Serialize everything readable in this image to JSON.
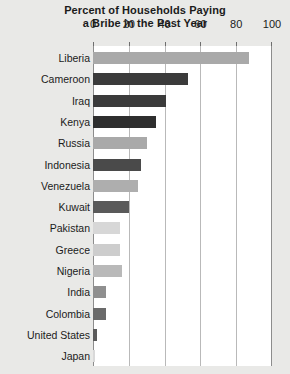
{
  "title": {
    "line1": "Percent of Households Paying",
    "line2": "a Bribe in the Past Year"
  },
  "axis": {
    "ticks": [
      "0",
      "20",
      "40",
      "60",
      "80",
      "100"
    ]
  },
  "chart_data": {
    "type": "bar",
    "orientation": "horizontal",
    "title": "Percent of Households Paying a Bribe in the Past Year",
    "xlabel": "",
    "ylabel": "",
    "xlim": [
      0,
      100
    ],
    "xticks": [
      0,
      20,
      40,
      60,
      80,
      100
    ],
    "grid": true,
    "legend": "none",
    "categories": [
      "Liberia",
      "Cameroon",
      "Iraq",
      "Kenya",
      "Russia",
      "Indonesia",
      "Venezuela",
      "Kuwait",
      "Pakistan",
      "Greece",
      "Nigeria",
      "India",
      "Colombia",
      "United States",
      "Japan"
    ],
    "values": [
      87,
      53,
      41,
      35,
      30,
      27,
      25,
      20,
      15,
      15,
      16,
      7,
      7,
      2,
      1
    ],
    "bar_colors": [
      "#a9a9a9",
      "#3b3b3b",
      "#3b3b3b",
      "#2e2e2e",
      "#a9a9a9",
      "#4a4a4a",
      "#aeaeae",
      "#5a5a5a",
      "#d7d7d7",
      "#cdcdcd",
      "#b9b9b9",
      "#8f8f8f",
      "#6a6a6a",
      "#5a5a5a",
      "#d9d9d9"
    ]
  },
  "colors": {
    "page_background": "#e9e9e7",
    "plot_background": "#ffffff",
    "gridline": "#b9b9b9",
    "axis": "#8d8d8d",
    "text": "#1b1b1b"
  }
}
